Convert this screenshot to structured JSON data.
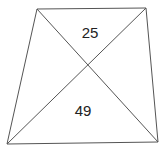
{
  "diagram": {
    "type": "trapezoid-with-diagonals",
    "vertices": {
      "top_left": [
        37,
        9
      ],
      "top_right": [
        146,
        8
      ],
      "bottom_right": [
        158,
        142
      ],
      "bottom_left": [
        7,
        144
      ]
    },
    "stroke_color": "#555555",
    "labels": [
      {
        "text": "25",
        "x": 90,
        "y": 38,
        "region": "top-triangle"
      },
      {
        "text": "49",
        "x": 83,
        "y": 116,
        "region": "bottom-triangle"
      }
    ]
  }
}
